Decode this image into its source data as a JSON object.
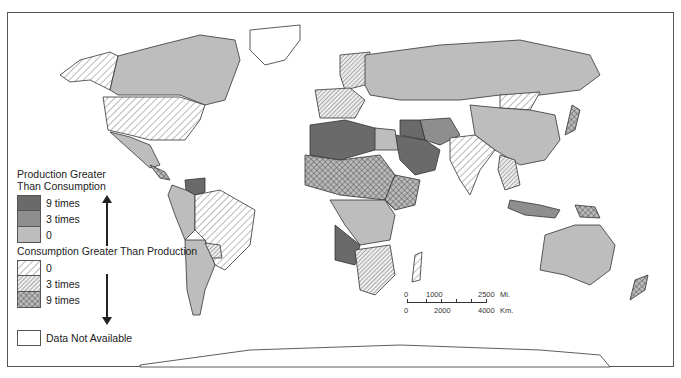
{
  "legend": {
    "production_title_line1": "Production Greater",
    "production_title_line2": "Than Consumption",
    "production_items": [
      {
        "label": "9 times",
        "color": "#6a6a6a",
        "pattern": "solid"
      },
      {
        "label": "3 times",
        "color": "#8e8e8e",
        "pattern": "solid"
      },
      {
        "label": "0",
        "color": "#bdbdbd",
        "pattern": "solid"
      }
    ],
    "consumption_title": "Consumption Greater Than Production",
    "consumption_items": [
      {
        "label": "0",
        "pattern": "light-diagonal-hatch"
      },
      {
        "label": "3 times",
        "pattern": "dense-diagonal-hatch"
      },
      {
        "label": "9 times",
        "pattern": "crosshatch"
      }
    ],
    "na_label": "Data Not Available"
  },
  "scale": {
    "miles_ticks": [
      "0",
      "1000",
      "2500"
    ],
    "miles_unit": "Mi.",
    "km_ticks": [
      "0",
      "2000",
      "4000"
    ],
    "km_unit": "Km."
  }
}
